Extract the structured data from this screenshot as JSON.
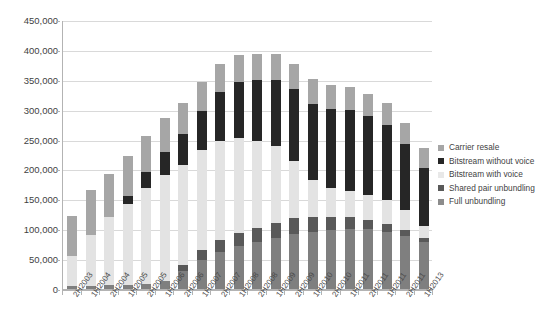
{
  "chart_data": {
    "type": "bar",
    "subtype": "stacked-vertical",
    "title": "",
    "xlabel": "",
    "ylabel": "",
    "ylim": [
      0,
      450000
    ],
    "ytick_labels": [
      "450,000",
      "400,000",
      "350,000",
      "300,000",
      "250,000",
      "200,000",
      "150,000",
      "100,000",
      "50,000",
      "0"
    ],
    "ytick_values": [
      450000,
      400000,
      350000,
      300000,
      250000,
      200000,
      150000,
      100000,
      50000,
      0
    ],
    "ytick_step": 50000,
    "grid": true,
    "legend_position": "right",
    "categories": [
      "2H2003",
      "1H2004",
      "2H2004",
      "1H2005",
      "2H2005",
      "1H2006",
      "2H2006",
      "1H2007",
      "2H2007",
      "1H2008",
      "2H2008",
      "1H2009",
      "2H2009",
      "1H2010",
      "2H2010",
      "1H2011",
      "2H2011",
      "1H2011",
      "2H2011",
      "1H2013"
    ],
    "series": [
      {
        "name": "Full unbundling",
        "color": "#7f7f7f",
        "values": [
          5000,
          5000,
          6000,
          7000,
          9000,
          13000,
          30000,
          48000,
          62000,
          72000,
          78000,
          85000,
          92000,
          96000,
          99000,
          101000,
          100000,
          96000,
          88000,
          78000
        ]
      },
      {
        "name": "Shared pair unbundling",
        "color": "#595959",
        "values": [
          0,
          0,
          0,
          0,
          0,
          0,
          10000,
          17000,
          20000,
          22000,
          24000,
          25000,
          26000,
          24000,
          22000,
          19000,
          16000,
          13000,
          10000,
          7000
        ]
      },
      {
        "name": "Bitstream with voice",
        "color": "#e3e3e3",
        "values": [
          50000,
          85000,
          114000,
          135000,
          160000,
          178000,
          168000,
          168000,
          166000,
          158000,
          146000,
          130000,
          97000,
          63000,
          48000,
          44000,
          42000,
          40000,
          34000,
          21000
        ]
      },
      {
        "name": "Bitstream without voice",
        "color": "#262626",
        "values": [
          0,
          0,
          0,
          13000,
          26000,
          38000,
          52000,
          65000,
          81000,
          95000,
          102000,
          110000,
          119000,
          127000,
          133000,
          136000,
          132000,
          126000,
          110000,
          96000
        ]
      },
      {
        "name": "Carrier resale",
        "color": "#a6a6a6",
        "values": [
          68000,
          75000,
          72000,
          67000,
          61000,
          57000,
          52000,
          49000,
          47000,
          45000,
          44000,
          43000,
          42000,
          41000,
          40000,
          38000,
          37000,
          36000,
          35000,
          34000
        ]
      }
    ],
    "totals": [
      123000,
      165000,
      192000,
      222000,
      256000,
      286000,
      312000,
      347000,
      376000,
      392000,
      394000,
      393000,
      376000,
      351000,
      342000,
      338000,
      327000,
      311000,
      277000,
      236000
    ],
    "stack_order_bottom_to_top": [
      "Full unbundling",
      "Shared pair unbundling",
      "Bitstream with voice",
      "Bitstream without voice",
      "Carrier resale"
    ]
  },
  "legend": {
    "items": [
      {
        "label": "Carrier resale",
        "color": "#a6a6a6"
      },
      {
        "label": "Bitstream without voice",
        "color": "#262626"
      },
      {
        "label": "Bitstream with voice",
        "color": "#e8e8e8"
      },
      {
        "label": "Shared pair unbundling",
        "color": "#595959"
      },
      {
        "label": "Full unbundling",
        "color": "#8c8c8c"
      }
    ]
  },
  "axis_colors": {
    "gridline": "#d9d9d9",
    "axis": "#b3b3b3",
    "text": "#3f3f3f"
  }
}
